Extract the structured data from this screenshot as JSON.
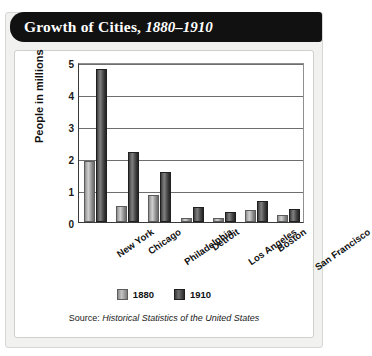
{
  "title": {
    "main": "Growth of Cities,",
    "years": "1880–1910"
  },
  "legend": {
    "items": [
      {
        "label": "1880",
        "color": "#b0b0b0"
      },
      {
        "label": "1910",
        "color": "#333333"
      }
    ]
  },
  "source": {
    "prefix": "Source: ",
    "title": "Historical Statistics of the United States"
  },
  "chart_data": {
    "type": "bar",
    "title": "Growth of Cities, 1880–1910",
    "xlabel": "",
    "ylabel": "People in millions",
    "ylim": [
      0,
      5
    ],
    "yticks": [
      "0",
      "1",
      "2",
      "3",
      "4",
      "5"
    ],
    "grid": true,
    "legend_position": "bottom",
    "categories": [
      "New York",
      "Chicago",
      "Philadelphia",
      "Detroit",
      "Los Angeles",
      "Boston",
      "San Francisco"
    ],
    "series": [
      {
        "name": "1880",
        "color": "#b0b0b0",
        "values": [
          1.9,
          0.5,
          0.85,
          0.12,
          0.11,
          0.36,
          0.23
        ]
      },
      {
        "name": "1910",
        "color": "#333333",
        "values": [
          4.77,
          2.2,
          1.55,
          0.47,
          0.32,
          0.67,
          0.42
        ]
      }
    ]
  }
}
